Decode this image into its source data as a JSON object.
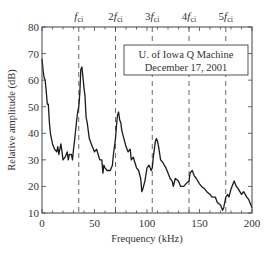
{
  "chart_data": {
    "type": "line",
    "title": "",
    "xlabel": "Frequency (kHz)",
    "ylabel": "Relative amplitude (dB)",
    "xlim": [
      0,
      200
    ],
    "ylim": [
      10,
      80
    ],
    "xticks": [
      0,
      50,
      100,
      150,
      200
    ],
    "yticks": [
      10,
      20,
      30,
      40,
      50,
      60,
      70,
      80
    ],
    "grid": false,
    "legend_position": "upper right",
    "annotation_box": [
      "U. of Iowa Q Machine",
      "December 17, 2001"
    ],
    "harmonic_lines": [
      {
        "label": "f",
        "sub": "ci",
        "prefix": "",
        "x": 35
      },
      {
        "label": "f",
        "sub": "ci",
        "prefix": "2",
        "x": 70
      },
      {
        "label": "f",
        "sub": "ci",
        "prefix": "3",
        "x": 105
      },
      {
        "label": "f",
        "sub": "ci",
        "prefix": "4",
        "x": 140
      },
      {
        "label": "f",
        "sub": "ci",
        "prefix": "5",
        "x": 175
      }
    ],
    "series": [
      {
        "name": "spectrum",
        "x": [
          0,
          1,
          2,
          3,
          4,
          5,
          6,
          7,
          8,
          10,
          12,
          14,
          15,
          16,
          18,
          19,
          20,
          22,
          24,
          25,
          26,
          28,
          29,
          30,
          31,
          33,
          34,
          35,
          36,
          37,
          38,
          39,
          40,
          41,
          42,
          43,
          45,
          47,
          50,
          52,
          55,
          57,
          58,
          59,
          60,
          62,
          65,
          67,
          68,
          70,
          71,
          72,
          73,
          74,
          75,
          76,
          78,
          80,
          82,
          84,
          85,
          87,
          90,
          92,
          94,
          95,
          96,
          98,
          100,
          102,
          104,
          105,
          106,
          108,
          109,
          110,
          111,
          113,
          115,
          118,
          120,
          122,
          124,
          125,
          127,
          130,
          132,
          135,
          137,
          140,
          141,
          143,
          145,
          147,
          150,
          152,
          155,
          157,
          160,
          162,
          165,
          167,
          170,
          172,
          173,
          175,
          177,
          178,
          180,
          182,
          183,
          185,
          187,
          190,
          192,
          195,
          197,
          200
        ],
        "values": [
          68,
          64,
          61,
          60,
          56,
          51,
          51,
          44,
          40,
          36,
          34,
          33,
          35,
          32,
          36,
          33,
          30,
          31,
          33,
          30,
          32,
          32,
          30,
          34,
          37,
          45,
          48,
          50,
          55,
          64,
          65,
          61,
          57,
          54,
          46,
          44,
          38,
          36,
          33,
          34,
          30,
          30,
          25,
          28,
          27,
          26,
          26,
          28,
          32,
          38,
          43,
          47,
          48,
          45,
          44,
          41,
          38,
          35,
          33,
          34,
          30,
          31,
          27,
          26,
          23,
          18,
          19,
          22,
          27,
          28,
          26,
          27,
          31,
          37,
          38,
          37,
          35,
          30,
          29,
          27,
          25,
          23,
          22,
          20,
          23,
          22,
          20,
          20,
          21,
          22,
          25,
          26,
          24,
          23,
          21,
          20,
          19,
          18,
          17,
          16,
          16,
          14,
          13,
          11,
          12,
          16,
          17,
          16,
          19,
          21,
          22,
          20,
          19,
          17,
          18,
          16,
          15,
          12
        ]
      }
    ]
  }
}
